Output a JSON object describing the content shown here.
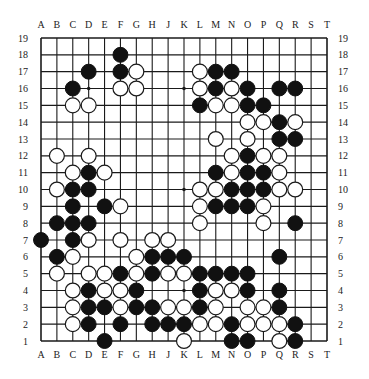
{
  "diagram": {
    "type": "go-board",
    "size": 19,
    "columns": [
      "A",
      "B",
      "C",
      "D",
      "E",
      "F",
      "G",
      "H",
      "J",
      "K",
      "L",
      "M",
      "N",
      "O",
      "P",
      "Q",
      "R",
      "S",
      "T"
    ],
    "rows": [
      "19",
      "18",
      "17",
      "16",
      "15",
      "14",
      "13",
      "12",
      "11",
      "10",
      "9",
      "8",
      "7",
      "6",
      "5",
      "4",
      "3",
      "2",
      "1"
    ],
    "colors": {
      "black": "#111111",
      "white": "#ffffff",
      "line": "#1a1a1a",
      "background": "#ffffff"
    },
    "star_points": [
      "D16",
      "K16",
      "Q16",
      "D10",
      "K10",
      "Q10",
      "D4",
      "K4",
      "Q4"
    ],
    "stones": {
      "black": [
        "F18",
        "D17",
        "F17",
        "M17",
        "N17",
        "C16",
        "M16",
        "O16",
        "Q16",
        "R16",
        "L15",
        "O15",
        "P15",
        "Q14",
        "Q13",
        "R13",
        "O12",
        "D11",
        "M11",
        "O11",
        "P11",
        "C10",
        "D10",
        "N10",
        "O10",
        "P10",
        "C9",
        "E9",
        "M9",
        "N9",
        "O9",
        "B8",
        "C8",
        "D8",
        "R8",
        "A7",
        "C7",
        "B6",
        "H6",
        "J6",
        "K6",
        "Q6",
        "F5",
        "H5",
        "L5",
        "M5",
        "N5",
        "O5",
        "D4",
        "G4",
        "L4",
        "O4",
        "Q4",
        "D3",
        "E3",
        "G3",
        "H3",
        "L3",
        "Q3",
        "D2",
        "F2",
        "H2",
        "J2",
        "K2",
        "N2",
        "R2",
        "E1",
        "N1",
        "O1",
        "R1"
      ],
      "white": [
        "G17",
        "L17",
        "F16",
        "G16",
        "L16",
        "N16",
        "C15",
        "D15",
        "M15",
        "N15",
        "O14",
        "P14",
        "R14",
        "M13",
        "O13",
        "B12",
        "D12",
        "N12",
        "P12",
        "Q12",
        "C11",
        "E11",
        "N11",
        "Q11",
        "B10",
        "L10",
        "M10",
        "Q10",
        "R10",
        "F9",
        "L9",
        "P9",
        "L8",
        "P8",
        "D7",
        "F7",
        "H7",
        "J7",
        "C6",
        "G6",
        "B5",
        "D5",
        "E5",
        "G5",
        "J5",
        "K5",
        "C4",
        "E4",
        "F4",
        "M4",
        "N4",
        "C3",
        "F3",
        "J3",
        "K3",
        "M3",
        "O3",
        "P3",
        "C2",
        "L2",
        "M2",
        "O2",
        "P2",
        "Q2",
        "K1",
        "Q1"
      ]
    }
  }
}
